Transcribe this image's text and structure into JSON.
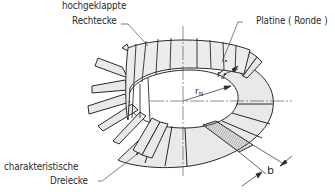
{
  "figure": {
    "type": "technical-illustration",
    "colors": {
      "line": "#2a2a2a",
      "fill": "#e6e6e6",
      "background": "#ffffff",
      "hatch": "#555555"
    }
  },
  "labels": {
    "folded_rectangles_line1": "hochgeklappte",
    "folded_rectangles_line2": "Rechtecke",
    "blank": "Platine ( Ronde )",
    "characteristic_triangles_line1": "charakteristische",
    "characteristic_triangles_line2": "Dreiecke",
    "outer_radius_symbol": "r",
    "outer_radius_subscript": "a",
    "inner_radius_symbol": "r",
    "inner_radius_subscript": "N",
    "width_symbol": "b"
  }
}
